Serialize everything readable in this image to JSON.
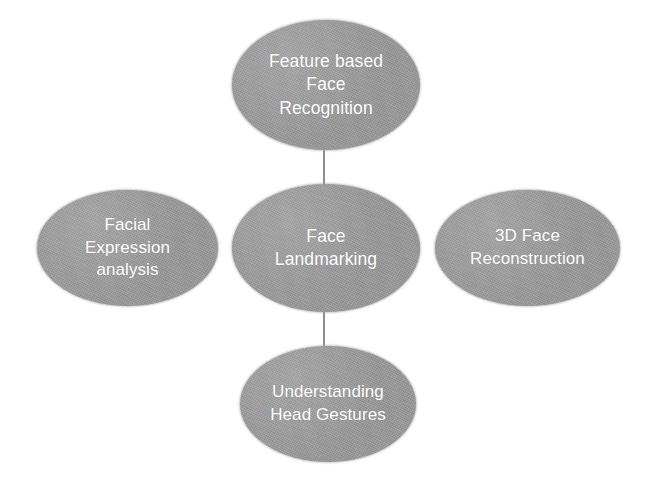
{
  "diagram": {
    "background_color": "#ffffff",
    "node_fill_color": "#9a9a9a",
    "node_text_color": "#ffffff",
    "connector_color": "#8f8f8f",
    "nodes": {
      "center": {
        "id": "face-landmarking",
        "label": "Face\nLandmarking",
        "role": "central-topic"
      },
      "top": {
        "id": "feature-based-face-recognition",
        "label": "Feature based\nFace\nRecognition",
        "role": "application"
      },
      "left": {
        "id": "facial-expression-analysis",
        "label": "Facial\nExpression\nanalysis",
        "role": "application"
      },
      "right": {
        "id": "3d-face-reconstruction",
        "label": "3D Face\nReconstruction",
        "role": "application"
      },
      "bottom": {
        "id": "understanding-head-gestures",
        "label": "Understanding\nHead Gestures",
        "role": "application"
      }
    },
    "connectors": [
      {
        "id": "top-to-center",
        "from": "feature-based-face-recognition",
        "to": "face-landmarking",
        "orientation": "vertical"
      },
      {
        "id": "center-to-bottom",
        "from": "face-landmarking",
        "to": "understanding-head-gestures",
        "orientation": "vertical"
      }
    ]
  }
}
